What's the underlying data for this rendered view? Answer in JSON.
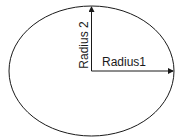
{
  "diagram": {
    "type": "ellipse-radii",
    "stroke_color": "#1a1a1a",
    "background": "#ffffff",
    "ellipse": {
      "cx": 91.5,
      "cy": 71,
      "rx": 82.5,
      "ry": 65
    },
    "labels": {
      "radius_horizontal": "Radius1",
      "radius_vertical": "Radius 2"
    }
  }
}
